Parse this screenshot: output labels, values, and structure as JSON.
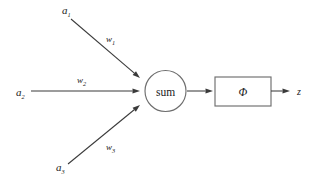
{
  "diagram": {
    "type": "neural-network-node",
    "canvas": {
      "width": 316,
      "height": 182,
      "background": "#ffffff"
    },
    "colors": {
      "line": "#3a3a3a",
      "node_stroke": "#6e6e6e",
      "text": "#1a1a1a",
      "background": "#ffffff"
    },
    "inputs": [
      {
        "id": "a1",
        "label": "a",
        "subscript": "1",
        "label_x": 62,
        "label_y": 14,
        "weight_label": "w",
        "weight_subscript": "1",
        "weight_x": 106,
        "weight_y": 42,
        "line": {
          "x1": 71,
          "y1": 19,
          "x2": 140,
          "y2": 78
        }
      },
      {
        "id": "a2",
        "label": "a",
        "subscript": "2",
        "label_x": 16,
        "label_y": 96,
        "weight_label": "w",
        "weight_subscript": "2",
        "weight_x": 77,
        "weight_y": 83,
        "line": {
          "x1": 31,
          "y1": 91,
          "x2": 140,
          "y2": 91
        }
      },
      {
        "id": "a3",
        "label": "a",
        "subscript": "3",
        "label_x": 56,
        "label_y": 171,
        "weight_label": "w",
        "weight_subscript": "3",
        "weight_x": 106,
        "weight_y": 150,
        "line": {
          "x1": 68,
          "y1": 164,
          "x2": 140,
          "y2": 105
        }
      }
    ],
    "summation_node": {
      "label": "sum",
      "cx": 165.5,
      "cy": 91,
      "r": 20.5,
      "font_size": 11.5
    },
    "activation_node": {
      "label": "Φ",
      "x": 215,
      "y": 77,
      "width": 56,
      "height": 29,
      "font_size": 11.5
    },
    "connector_sum_to_activation": {
      "x1": 187,
      "y1": 91,
      "x2": 213,
      "y2": 91
    },
    "output": {
      "label": "z",
      "label_x": 297,
      "label_y": 95,
      "line": {
        "x1": 271,
        "y1": 91,
        "x2": 290,
        "y2": 91
      }
    },
    "arrowhead": {
      "length": 7.5,
      "half_width": 2.6
    }
  }
}
